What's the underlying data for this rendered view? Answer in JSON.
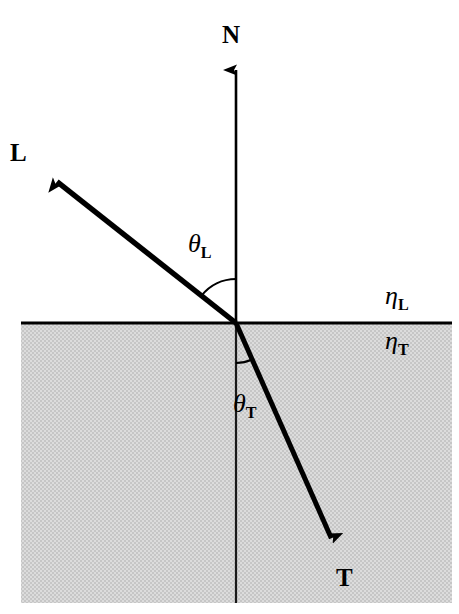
{
  "figure": {
    "kind": "optics-refraction-diagram",
    "width": 459,
    "height": 614,
    "background_color": "#ffffff",
    "medium_fill_color": "#d2d2d2",
    "stroke_color": "#000000"
  },
  "labels": {
    "normal_vector": "N",
    "light_vector": "L",
    "transmitted_vector": "T",
    "incident_angle": "θ",
    "incident_angle_sub": "L",
    "transmitted_angle": "θ",
    "transmitted_angle_sub": "T",
    "eta_upper": "η",
    "eta_upper_sub": "L",
    "eta_lower": "η",
    "eta_lower_sub": "T"
  },
  "geometry": {
    "origin": {
      "x": 236,
      "y": 323
    },
    "interface_line": {
      "x1": 21,
      "y1": 323,
      "x2": 452,
      "y2": 323
    },
    "medium_rect": {
      "x": 21,
      "y": 323,
      "width": 431,
      "height": 280
    },
    "normal_ray": {
      "x1": 236,
      "y1": 323,
      "x2": 236,
      "y2": 57,
      "arrow": "end"
    },
    "normal_axis_below": {
      "x1": 236,
      "y1": 323,
      "x2": 236,
      "y2": 603,
      "arrow": "none"
    },
    "light_ray": {
      "x1": 236,
      "y1": 323,
      "x2": 46,
      "y2": 173,
      "arrow": "end"
    },
    "transmitted_ray": {
      "x1": 236,
      "y1": 323,
      "x2": 337,
      "y2": 551,
      "arrow": "end"
    },
    "incident_arc_radius": 44,
    "transmitted_arc_radius": 40,
    "incident_angle_degrees": 52,
    "transmitted_angle_degrees": 24
  },
  "label_positions": {
    "normal": {
      "x": 222,
      "y": 22
    },
    "light": {
      "x": 10,
      "y": 140
    },
    "transmitted": {
      "x": 336,
      "y": 565
    },
    "incident_angle": {
      "x": 188,
      "y": 231
    },
    "transmitted_angle": {
      "x": 233,
      "y": 391
    },
    "eta_upper": {
      "x": 385,
      "y": 283
    },
    "eta_lower": {
      "x": 385,
      "y": 328
    }
  }
}
